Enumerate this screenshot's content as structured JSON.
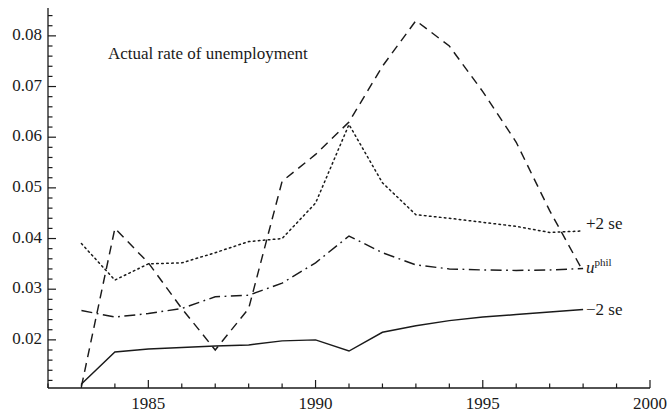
{
  "figure": {
    "background_color": "#ffffff",
    "line_color": "#1a1a1a"
  },
  "annotations": {
    "title_note": "Actual rate of unemployment",
    "legend_plus2se": "+2 se",
    "legend_uphil_base": "u",
    "legend_uphil_sup": "phil",
    "legend_minus2se": "−2 se"
  },
  "chart_data": {
    "type": "line",
    "title": "Actual rate of unemployment",
    "xlabel": "",
    "ylabel": "",
    "xlim": [
      1982.0,
      2000.0
    ],
    "ylim": [
      0.0105,
      0.0855
    ],
    "grid": false,
    "legend_position": "right-inline",
    "x_ticks_major": [
      1985,
      1990,
      1995,
      2000
    ],
    "x_tick_labels": [
      "1985",
      "1990",
      "1995",
      "2000"
    ],
    "x_ticks_minor_step": 1,
    "y_ticks_major": [
      0.02,
      0.03,
      0.04,
      0.05,
      0.06,
      0.07,
      0.08
    ],
    "y_tick_labels": [
      "0.02",
      "0.03",
      "0.04",
      "0.05",
      "0.06",
      "0.07",
      "0.08"
    ],
    "y_ticks_minor_step": 0.002,
    "x": [
      1983,
      1984,
      1985,
      1986,
      1987,
      1988,
      1989,
      1990,
      1991,
      1992,
      1993,
      1994,
      1995,
      1996,
      1997,
      1998
    ],
    "series": [
      {
        "name": "Actual rate of unemployment",
        "style": "dashed",
        "label": "Actual rate of unemployment",
        "values": [
          0.0108,
          0.042,
          0.0352,
          0.0262,
          0.018,
          0.0262,
          0.0513,
          0.0566,
          0.063,
          0.074,
          0.083,
          0.078,
          0.069,
          0.059,
          0.0455,
          0.0335
        ]
      },
      {
        "name": "+2 se",
        "style": "dotted",
        "label": "+2 se",
        "values": [
          0.039,
          0.0318,
          0.035,
          0.0352,
          0.0372,
          0.0394,
          0.04,
          0.047,
          0.0625,
          0.051,
          0.0447,
          0.044,
          0.0432,
          0.0424,
          0.0412,
          0.0415
        ]
      },
      {
        "name": "u^phil",
        "style": "dash-dot",
        "label": "u phil",
        "values": [
          0.0258,
          0.0245,
          0.0252,
          0.0262,
          0.0285,
          0.0288,
          0.0312,
          0.0352,
          0.0405,
          0.0372,
          0.0348,
          0.034,
          0.0338,
          0.0337,
          0.0338,
          0.0341
        ]
      },
      {
        "name": "-2 se",
        "style": "solid",
        "label": "−2 se",
        "values": [
          0.0113,
          0.0176,
          0.0182,
          0.0185,
          0.0188,
          0.019,
          0.0198,
          0.02,
          0.0178,
          0.0215,
          0.0228,
          0.0238,
          0.0245,
          0.025,
          0.0255,
          0.026
        ]
      }
    ]
  }
}
